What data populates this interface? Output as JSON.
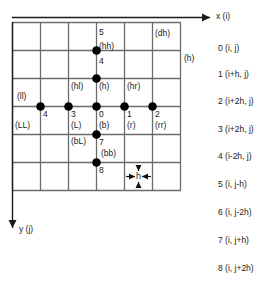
{
  "figure": {
    "title": "",
    "type": "stencil-diagram",
    "axes": {
      "x_label": "x (i)",
      "y_label": "y (j)"
    },
    "grid": {
      "cols": 6,
      "rows": 6,
      "spacing_label": "h"
    },
    "node_labels": [
      {
        "id": "0",
        "text": "0",
        "x": 89,
        "y": 110
      },
      {
        "id": "1",
        "text": "1",
        "x": 117,
        "y": 110
      },
      {
        "id": "2",
        "text": "2",
        "x": 145,
        "y": 110
      },
      {
        "id": "3",
        "text": "3",
        "x": 61,
        "y": 110
      },
      {
        "id": "4",
        "text": "4",
        "x": 33,
        "y": 110
      },
      {
        "id": "5",
        "text": "5",
        "x": 89,
        "y": 61
      },
      {
        "id": "6",
        "text": "6",
        "x": 89,
        "y": 33
      },
      {
        "id": "7",
        "text": "7",
        "x": 89,
        "y": 134
      },
      {
        "id": "8",
        "text": "8",
        "x": 89,
        "y": 162
      }
    ],
    "tag_labels": [
      {
        "id": "b",
        "text": "(b)",
        "x": 89,
        "y": 122
      },
      {
        "id": "r",
        "text": "(r)",
        "x": 117,
        "y": 122
      },
      {
        "id": "rr",
        "text": "(rr)",
        "x": 145,
        "y": 122
      },
      {
        "id": "L",
        "text": "(L)",
        "x": 61,
        "y": 122
      },
      {
        "id": "LL",
        "text": "(LL)",
        "x": 18,
        "y": 122
      },
      {
        "id": "ll",
        "text": "(ll)",
        "x": 18,
        "y": 92
      },
      {
        "id": "h",
        "text": "(h)",
        "x": 89,
        "y": 85
      },
      {
        "id": "hl",
        "text": "(hl)",
        "x": 61,
        "y": 85
      },
      {
        "id": "hr",
        "text": "(hr)",
        "x": 117,
        "y": 85
      },
      {
        "id": "hh",
        "text": "(hh)",
        "x": 89,
        "y": 45
      },
      {
        "id": "bL",
        "text": "(bL)",
        "x": 61,
        "y": 134
      },
      {
        "id": "bb",
        "text": "(bb)",
        "x": 89,
        "y": 147
      },
      {
        "id": "dh",
        "text": "(dh)",
        "x": 160,
        "y": 33
      },
      {
        "id": "hside",
        "text": "(h)",
        "x": 189,
        "y": 57
      }
    ],
    "spacing_annotation": "h",
    "legend": {
      "items": [
        {
          "index": "0",
          "text": "0 (i, j)"
        },
        {
          "index": "1",
          "text": "1 (i+h, j)"
        },
        {
          "index": "2",
          "text": "2 (i+2h, j)"
        },
        {
          "index": "3",
          "text": "3 (i+2h, j)"
        },
        {
          "index": "4",
          "text": "4 (i-2h, j)"
        },
        {
          "index": "5",
          "text": "5 (i, j-h)"
        },
        {
          "index": "6",
          "text": "6 (i, j-2h)"
        },
        {
          "index": "7",
          "text": "7 (i, j+h)"
        },
        {
          "index": "8",
          "text": "8 (i, j+2h)"
        }
      ]
    },
    "colors": {
      "grid_line": "#6b6b6b",
      "node": "#000000",
      "axis": "#1a1a1a",
      "text": "#1a1a1a",
      "background": "#ffffff"
    }
  }
}
